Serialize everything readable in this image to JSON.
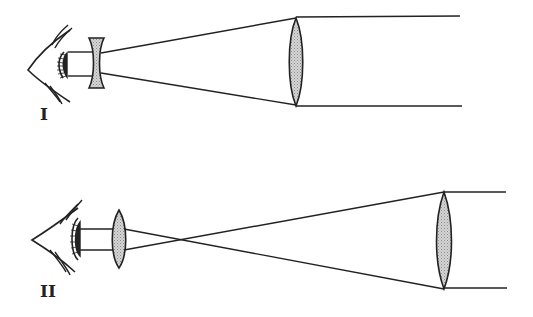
{
  "diagrams": [
    {
      "label": "I",
      "type": "Galilean telescope",
      "eyepiece": "concave-lens",
      "objective": "convex-lens"
    },
    {
      "label": "II",
      "type": "Keplerian telescope",
      "eyepiece": "convex-lens",
      "objective": "convex-lens"
    }
  ],
  "colors": {
    "line": "#222222",
    "lens_fill": "#c8c8c8",
    "background": "#ffffff"
  }
}
